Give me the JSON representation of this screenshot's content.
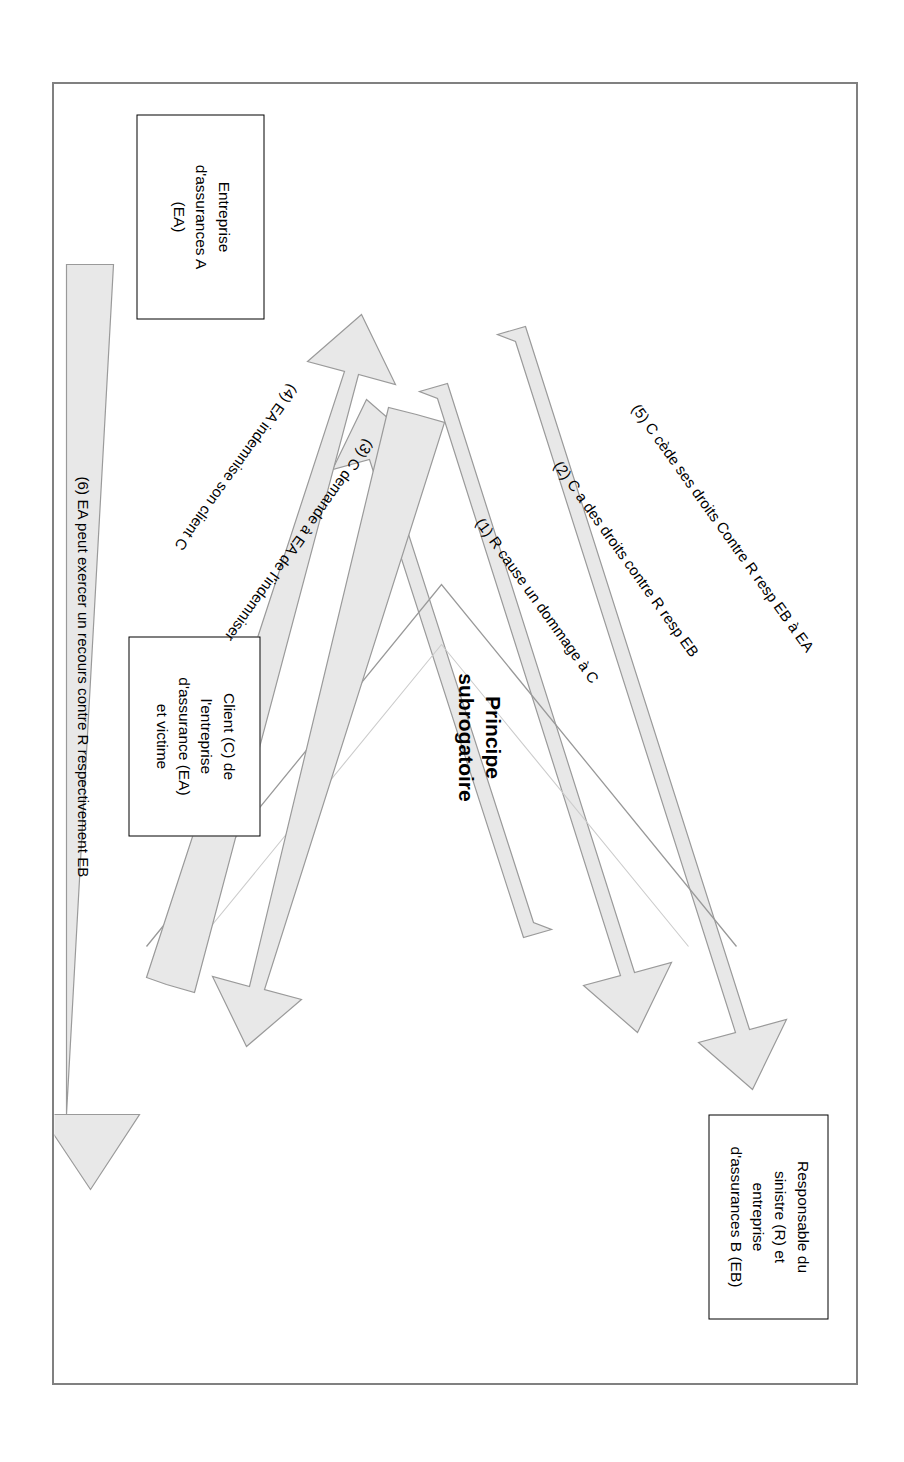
{
  "diagram": {
    "title": "Principe\nsubrogatoire",
    "colors": {
      "frame_border": "#808080",
      "box_border": "#000000",
      "arrow_fill": "#e8e8e8",
      "arrow_stroke": "#808080",
      "text": "#000000"
    },
    "boxes": [
      {
        "id": "responsable",
        "label": "Responsable du\nsinistre (R) et\nentreprise\nd'assurances B (EB)"
      },
      {
        "id": "client",
        "label": "Client (C) de\nl'entreprise\nd'assurance (EA)\net victime"
      },
      {
        "id": "entreprise",
        "label": "Entreprise\nd'assurances A\n(EA)"
      }
    ],
    "arrows": [
      {
        "id": "1",
        "label": "(1) R cause un dommage à C"
      },
      {
        "id": "2",
        "label": "(2) C a des droits contre R resp EB"
      },
      {
        "id": "3",
        "label": "(3) C demande à EA de l'indemniser"
      },
      {
        "id": "4",
        "label": "(4) EA indemnise son client C"
      },
      {
        "id": "5",
        "label": "(5) C cède ses droits Contre R resp EB à EA"
      },
      {
        "id": "6",
        "label": "(6) EA peut exercer un recours contre R respectivement EB"
      }
    ]
  }
}
